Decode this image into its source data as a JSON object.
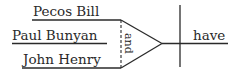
{
  "diagram": {
    "type": "sentence-diagram",
    "subjects": [
      {
        "text": "Pecos Bill"
      },
      {
        "text": "Paul Bunyan"
      },
      {
        "text": "John Henry"
      }
    ],
    "conjunction": "and",
    "verb": "have",
    "colors": {
      "ink": "#2a2a2a",
      "background": "#ffffff"
    }
  }
}
